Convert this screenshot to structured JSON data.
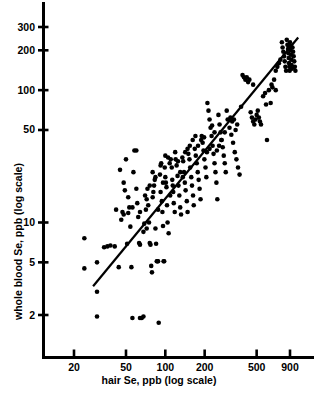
{
  "chart_data": {
    "type": "scatter",
    "title": "",
    "xlabel": "hair Se, ppb (log scale)",
    "ylabel": "whole blood Se, ppb (log scale)",
    "xscale": "log",
    "yscale": "log",
    "xlim": [
      14,
      1300
    ],
    "ylim": [
      1.55,
      430
    ],
    "grid": false,
    "legend": null,
    "xticks": [
      20,
      50,
      100,
      200,
      500,
      900
    ],
    "xticklabels": [
      "20",
      "50",
      "100",
      "200",
      "500",
      "900"
    ],
    "yticks": [
      2,
      5,
      10,
      50,
      100,
      200,
      300
    ],
    "yticklabels": [
      "2",
      "5",
      "10",
      "50",
      "100",
      "200",
      "300"
    ],
    "marker": "filled-circle",
    "marker_color": "#000000",
    "marker_size_px": 4.6,
    "line_color": "#000000",
    "line_width_px": 2.2,
    "fit_line": {
      "label": "regression line",
      "x_start": 28,
      "y_start": 3.3,
      "x_end": 1040,
      "y_end": 250
    },
    "points": [
      [
        24,
        7.6
      ],
      [
        24,
        4.5
      ],
      [
        30,
        5.0
      ],
      [
        30,
        3.0
      ],
      [
        30,
        1.95
      ],
      [
        34,
        6.5
      ],
      [
        36,
        6.6
      ],
      [
        38,
        6.7
      ],
      [
        41,
        6.6
      ],
      [
        44,
        4.6
      ],
      [
        46,
        10.5
      ],
      [
        47,
        12.0
      ],
      [
        48,
        11.5
      ],
      [
        49,
        17.5
      ],
      [
        50,
        30.0
      ],
      [
        51,
        6.9
      ],
      [
        52,
        11.8
      ],
      [
        53,
        13.0
      ],
      [
        54,
        9.3
      ],
      [
        55,
        4.6
      ],
      [
        56,
        1.9
      ],
      [
        57,
        24.0
      ],
      [
        58,
        35.0
      ],
      [
        60,
        35.0
      ],
      [
        61,
        14.0
      ],
      [
        62,
        11.0
      ],
      [
        63,
        7.0
      ],
      [
        64,
        6.8
      ],
      [
        64,
        1.9
      ],
      [
        66,
        1.9
      ],
      [
        68,
        1.95
      ],
      [
        69,
        9.8
      ],
      [
        70,
        16.0
      ],
      [
        71,
        12.5
      ],
      [
        72,
        15.0
      ],
      [
        73,
        18.0
      ],
      [
        74,
        13.5
      ],
      [
        75,
        10.0
      ],
      [
        76,
        7.0
      ],
      [
        77,
        6.8
      ],
      [
        78,
        4.7
      ],
      [
        79,
        4.2
      ],
      [
        80,
        15.5
      ],
      [
        81,
        17.0
      ],
      [
        82,
        19.0
      ],
      [
        83,
        21.0
      ],
      [
        84,
        9.0
      ],
      [
        85,
        6.9
      ],
      [
        86,
        5.1
      ],
      [
        87,
        5.1
      ],
      [
        88,
        5.1
      ],
      [
        89,
        1.75
      ],
      [
        91,
        23.0
      ],
      [
        92,
        27.0
      ],
      [
        93,
        28.0
      ],
      [
        94,
        14.5
      ],
      [
        95,
        12.0
      ],
      [
        96,
        9.4
      ],
      [
        97,
        5.1
      ],
      [
        98,
        5.1
      ],
      [
        99,
        26.0
      ],
      [
        100,
        22.0
      ],
      [
        101,
        20.0
      ],
      [
        102,
        18.5
      ],
      [
        103,
        13.5
      ],
      [
        104,
        10.0
      ],
      [
        106,
        8.3
      ],
      [
        108,
        28.0
      ],
      [
        110,
        30.0
      ],
      [
        112,
        26.0
      ],
      [
        113,
        21.0
      ],
      [
        115,
        17.0
      ],
      [
        116,
        14.0
      ],
      [
        118,
        12.0
      ],
      [
        120,
        30.0
      ],
      [
        122,
        27.0
      ],
      [
        124,
        22.5
      ],
      [
        126,
        19.0
      ],
      [
        128,
        16.0
      ],
      [
        130,
        13.0
      ],
      [
        132,
        11.5
      ],
      [
        135,
        31.0
      ],
      [
        137,
        29.0
      ],
      [
        139,
        24.0
      ],
      [
        141,
        20.0
      ],
      [
        143,
        17.5
      ],
      [
        146,
        14.5
      ],
      [
        148,
        12.0
      ],
      [
        150,
        33.0
      ],
      [
        153,
        30.0
      ],
      [
        155,
        26.0
      ],
      [
        158,
        22.0
      ],
      [
        160,
        19.0
      ],
      [
        163,
        16.0
      ],
      [
        165,
        13.5
      ],
      [
        168,
        36.0
      ],
      [
        171,
        32.0
      ],
      [
        174,
        28.0
      ],
      [
        177,
        24.0
      ],
      [
        180,
        21.0
      ],
      [
        183,
        18.0
      ],
      [
        186,
        15.0
      ],
      [
        190,
        45.0
      ],
      [
        193,
        40.0
      ],
      [
        196,
        35.0
      ],
      [
        199,
        30.0
      ],
      [
        203,
        26.0
      ],
      [
        206,
        22.0
      ],
      [
        210,
        80.0
      ],
      [
        214,
        70.0
      ],
      [
        218,
        60.0
      ],
      [
        222,
        52.0
      ],
      [
        226,
        45.0
      ],
      [
        230,
        38.0
      ],
      [
        234,
        33.0
      ],
      [
        238,
        28.0
      ],
      [
        242,
        24.0
      ],
      [
        246,
        20.0
      ],
      [
        250,
        15.0
      ],
      [
        255,
        65.0
      ],
      [
        260,
        55.0
      ],
      [
        265,
        48.0
      ],
      [
        270,
        42.0
      ],
      [
        275,
        37.0
      ],
      [
        280,
        32.0
      ],
      [
        285,
        28.0
      ],
      [
        290,
        24.0
      ],
      [
        300,
        60.0
      ],
      [
        310,
        52.0
      ],
      [
        320,
        46.0
      ],
      [
        330,
        40.0
      ],
      [
        340,
        34.0
      ],
      [
        350,
        30.0
      ],
      [
        360,
        26.0
      ],
      [
        370,
        23.0
      ],
      [
        380,
        75.0
      ],
      [
        390,
        130.0
      ],
      [
        400,
        125.0
      ],
      [
        410,
        120.0
      ],
      [
        420,
        125.0
      ],
      [
        430,
        115.0
      ],
      [
        440,
        120.0
      ],
      [
        450,
        68.0
      ],
      [
        460,
        62.0
      ],
      [
        470,
        58.0
      ],
      [
        480,
        55.0
      ],
      [
        490,
        60.0
      ],
      [
        500,
        65.0
      ],
      [
        510,
        70.0
      ],
      [
        520,
        62.0
      ],
      [
        530,
        58.0
      ],
      [
        540,
        55.0
      ],
      [
        560,
        90.0
      ],
      [
        580,
        95.0
      ],
      [
        600,
        42.0
      ],
      [
        620,
        100.0
      ],
      [
        650,
        110.0
      ],
      [
        680,
        120.0
      ],
      [
        700,
        140.0
      ],
      [
        720,
        150.0
      ],
      [
        740,
        160.0
      ],
      [
        760,
        170.0
      ],
      [
        780,
        230.0
      ],
      [
        790,
        210.0
      ],
      [
        800,
        195.0
      ],
      [
        810,
        180.0
      ],
      [
        820,
        165.0
      ],
      [
        830,
        150.0
      ],
      [
        840,
        140.0
      ],
      [
        850,
        240.0
      ],
      [
        860,
        220.0
      ],
      [
        870,
        205.0
      ],
      [
        875,
        190.0
      ],
      [
        880,
        175.0
      ],
      [
        885,
        160.0
      ],
      [
        890,
        150.0
      ],
      [
        895,
        140.0
      ],
      [
        900,
        230.0
      ],
      [
        905,
        215.0
      ],
      [
        910,
        200.0
      ],
      [
        915,
        185.0
      ],
      [
        920,
        170.0
      ],
      [
        925,
        155.0
      ],
      [
        930,
        145.0
      ],
      [
        940,
        210.0
      ],
      [
        950,
        195.0
      ],
      [
        960,
        180.0
      ],
      [
        970,
        165.0
      ],
      [
        980,
        150.0
      ],
      [
        990,
        140.0
      ],
      [
        700,
        100.0
      ],
      [
        660,
        105.0
      ],
      [
        640,
        80.0
      ],
      [
        590,
        78.0
      ],
      [
        470,
        110.0
      ],
      [
        355,
        55.0
      ],
      [
        345,
        50.0
      ],
      [
        335,
        60.0
      ],
      [
        325,
        58.0
      ],
      [
        315,
        62.0
      ],
      [
        295,
        70.0
      ],
      [
        285,
        48.0
      ],
      [
        268,
        42.0
      ],
      [
        258,
        38.0
      ],
      [
        248,
        35.0
      ],
      [
        238,
        48.0
      ],
      [
        228,
        54.0
      ],
      [
        218,
        36.0
      ],
      [
        208,
        34.0
      ],
      [
        198,
        44.0
      ],
      [
        188,
        42.0
      ],
      [
        178,
        38.0
      ],
      [
        170,
        45.0
      ],
      [
        162,
        42.0
      ],
      [
        154,
        38.0
      ],
      [
        148,
        36.0
      ],
      [
        142,
        34.0
      ],
      [
        136,
        22.0
      ],
      [
        130,
        24.0
      ],
      [
        125,
        29.0
      ],
      [
        119,
        34.0
      ],
      [
        114,
        19.0
      ],
      [
        109,
        16.0
      ],
      [
        105,
        31.0
      ],
      [
        100,
        32.0
      ],
      [
        96,
        20.0
      ],
      [
        92,
        17.0
      ],
      [
        88,
        12.5
      ],
      [
        84,
        22.0
      ],
      [
        80,
        24.0
      ],
      [
        76,
        19.0
      ],
      [
        72,
        9.0
      ],
      [
        68,
        8.5
      ],
      [
        64,
        12.0
      ],
      [
        60,
        18.0
      ],
      [
        56,
        13.0
      ],
      [
        52,
        15.5
      ],
      [
        48,
        20.0
      ],
      [
        45,
        25.0
      ],
      [
        42,
        12.5
      ]
    ]
  },
  "axes": {
    "x_title": "hair Se, ppb (log scale)",
    "y_title": "whole blood Se, ppb (log scale)",
    "x_tick_labels": [
      "20",
      "50",
      "100",
      "200",
      "500",
      "900"
    ],
    "y_tick_labels": [
      "300",
      "200",
      "100",
      "50",
      "10",
      "5",
      "2"
    ]
  },
  "colors": {
    "ink": "#000000",
    "background": "#ffffff"
  }
}
